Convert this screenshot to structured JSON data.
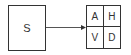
{
  "source": {
    "label": "S"
  },
  "grid": {
    "cells": [
      "A",
      "H",
      "V",
      "D"
    ]
  },
  "colors": {
    "stroke": "#333333",
    "background": "#ffffff"
  }
}
